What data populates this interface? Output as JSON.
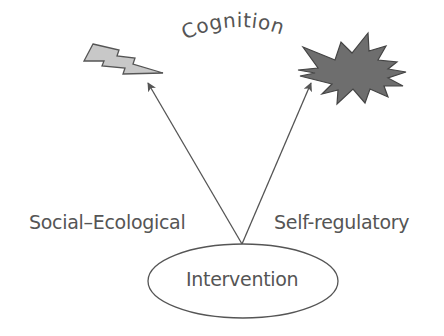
{
  "diagram": {
    "title_arc": "Cognition",
    "nodes": {
      "root": "Intervention"
    },
    "edges": [
      {
        "label": "Social–Ecological",
        "from": "Intervention",
        "to": "lightning-shape"
      },
      {
        "label": "Self-regulatory",
        "from": "Intervention",
        "to": "starburst-shape"
      }
    ],
    "shapes": {
      "lightning": {
        "fill": "#c8c8c8",
        "stroke": "#555555"
      },
      "starburst": {
        "fill": "#6e6e6e",
        "stroke": "#444444"
      }
    },
    "colors": {
      "text": "#555555",
      "line": "#555555",
      "background": "#ffffff"
    }
  }
}
